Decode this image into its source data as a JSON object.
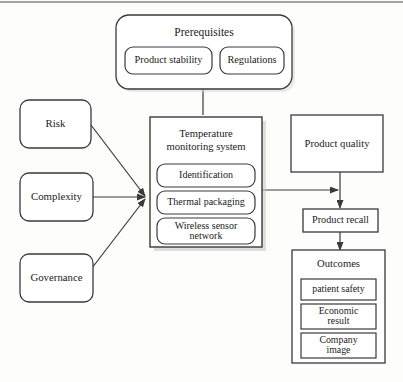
{
  "diagram": {
    "colors": {
      "stroke": "#3a3a3a",
      "fill": "#ffffff",
      "background": "#fdfdfc",
      "text": "#1a1a1a",
      "shadow": "#b8b8b8"
    },
    "top_banner": {
      "label": "Prerequisites",
      "items": [
        {
          "label": "Product stability"
        },
        {
          "label": "Regulations"
        }
      ]
    },
    "drivers": [
      {
        "label": "Risk"
      },
      {
        "label": "Complexity"
      },
      {
        "label": "Governance"
      }
    ],
    "core": {
      "label_line1": "Temperature",
      "label_line2": "monitoring system",
      "components": [
        {
          "label": "Identification",
          "line1": "Identification",
          "line2": ""
        },
        {
          "label": "Thermal packaging",
          "line1": "Thermal packaging",
          "line2": ""
        },
        {
          "label": "Wireless sensor network",
          "line1": "Wireless sensor",
          "line2": "network"
        }
      ]
    },
    "results": {
      "product_quality": {
        "label": "Product quality"
      },
      "product_recall": {
        "label": "Product recall"
      }
    },
    "outcomes": {
      "label": "Outcomes",
      "items": [
        {
          "label": "patient safety",
          "line1": "patient safety",
          "line2": ""
        },
        {
          "label": "Economic result",
          "line1": "Economic",
          "line2": "result"
        },
        {
          "label": "Company image",
          "line1": "Company",
          "line2": "image"
        }
      ]
    }
  }
}
